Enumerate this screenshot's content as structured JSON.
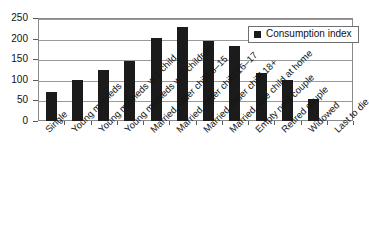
{
  "chart_data": {
    "type": "bar",
    "title": "",
    "subtitle": "",
    "xlabel": "",
    "ylabel": "",
    "ylim": [
      0,
      250
    ],
    "ytick_values": [
      0,
      50,
      100,
      150,
      200,
      250
    ],
    "ytick_labels": [
      "0",
      "50",
      "100",
      "150",
      "200",
      "250"
    ],
    "grid": true,
    "legend_position": "top-right",
    "bar_color": "#1b1b1b",
    "categories": [
      "Single",
      "Young marrieds",
      "Young marrieds w 1 child",
      "Young marrieds w 2 children",
      "Married, older child 6–15",
      "Married, older child 16–17",
      "Married, older child 18+",
      "Married, one child at home",
      "Empty nest couple",
      "Retired couple",
      "Widowed",
      "Last to die"
    ],
    "series": [
      {
        "name": "Consumption index",
        "values": [
          70,
          99,
          125,
          146,
          202,
          229,
          194,
          183,
          117,
          100,
          53,
          0
        ]
      }
    ]
  },
  "legend": {
    "entries": [
      {
        "label": "Consumption index",
        "color": "#1b1b1b",
        "marker": "square-marker"
      }
    ]
  }
}
